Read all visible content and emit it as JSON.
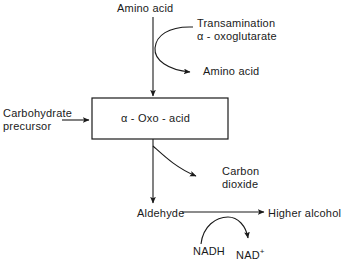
{
  "diagram": {
    "background_color": "#ffffff",
    "stroke_color": "#1a1a1a",
    "text_color": "#1a1a1a",
    "nodes": {
      "amino_acid_top": "Amino acid",
      "transamination": "Transamination",
      "oxoglutarate": "α - oxoglutarate",
      "amino_acid_out": "Amino acid",
      "carbohydrate_precursor": "Carbohydrate precursor",
      "oxo_acid_box": "α - Oxo - acid",
      "carbon_dioxide": "Carbon dioxide",
      "aldehyde": "Aldehyde",
      "higher_alcohol": "Higher alcohol",
      "nadh": "NADH",
      "nad_plus": "NAD",
      "nad_plus_charge": "+"
    },
    "edges": [
      {
        "from": "amino_acid_top",
        "to": "oxo_acid_box",
        "kind": "straight-arrow-down"
      },
      {
        "from": "transamination",
        "to": "amino_acid_out",
        "kind": "curved-arrow-left-bulge"
      },
      {
        "from": "carbohydrate_precursor",
        "to": "oxo_acid_box",
        "kind": "straight-arrow-right"
      },
      {
        "from": "oxo_acid_box",
        "to": "aldehyde",
        "kind": "straight-arrow-down"
      },
      {
        "from": "oxo_acid_box",
        "to": "carbon_dioxide",
        "kind": "curved-arrow-down-right"
      },
      {
        "from": "aldehyde",
        "to": "higher_alcohol",
        "kind": "straight-arrow-right"
      },
      {
        "from": "nadh",
        "to": "nad_plus",
        "kind": "curved-arrow-arc-over"
      }
    ]
  }
}
